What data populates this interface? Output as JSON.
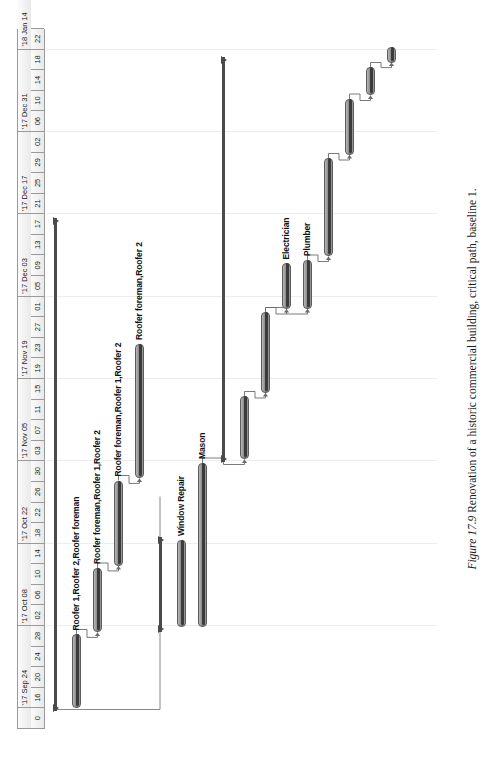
{
  "figure": {
    "number": "Figure 17.9",
    "caption": "Renovation of a historic commercial building, critical path, baseline 1.",
    "full_caption": "Figure 17.9 Renovation of a historic commercial building, critical path, baseline 1."
  },
  "chart_data": {
    "type": "bar",
    "subtype": "gantt",
    "title": "Renovation of a historic commercial building, critical path, baseline 1.",
    "orientation": "rotated-90-on-page",
    "xlabel": "",
    "ylabel": "",
    "grid": true,
    "legend_position": "none",
    "axis": {
      "name": "Timescale",
      "weeks": [
        "'17 Sep 24",
        "'17 Oct 08",
        "'17 Oct 22",
        "'17 Nov 05",
        "'17 Nov 19",
        "'17 Dec 03",
        "'17 Dec 17",
        "'17 Dec 31",
        "'18 Jan 14"
      ],
      "day_ticks": [
        "0",
        "16",
        "20",
        "24",
        "28",
        "02",
        "06",
        "10",
        "14",
        "18",
        "22",
        "26",
        "30",
        "03",
        "07",
        "11",
        "15",
        "19",
        "23",
        "27",
        "01",
        "05",
        "09",
        "13",
        "17",
        "21",
        "25",
        "29",
        "02",
        "06",
        "10",
        "14",
        "18",
        "22"
      ],
      "first_cell_label": "0",
      "range_start": "'17 Sep 16",
      "range_end": "'18 Jan 22"
    },
    "tasks": [
      {
        "id": 1,
        "name": "Project Summary",
        "kind": "summary",
        "label": "",
        "start_pct": 2.5,
        "end_pct": 73.0,
        "row": 0,
        "progress_pct": 0
      },
      {
        "id": 2,
        "name": "Roof demolition",
        "kind": "task",
        "label": "Roofer 1,Roofer 2,Roofer foreman",
        "start_pct": 3.0,
        "end_pct": 13.5,
        "row": 1,
        "progress_pct": 100
      },
      {
        "id": 3,
        "name": "Roof framing",
        "kind": "task",
        "label": "Roofer foreman,Roofer 1,Roofer 2",
        "start_pct": 13.8,
        "end_pct": 23.0,
        "row": 2,
        "progress_pct": 100
      },
      {
        "id": 4,
        "name": "Roof sheathing",
        "kind": "task",
        "label": "Roofer foreman,Roofer 1,Roofer 2",
        "start_pct": 23.3,
        "end_pct": 35.5,
        "row": 3,
        "progress_pct": 100
      },
      {
        "id": 5,
        "name": "Roof covering",
        "kind": "task",
        "label": "Roofer foreman,Roofer 2",
        "start_pct": 35.8,
        "end_pct": 55.0,
        "row": 4,
        "progress_pct": 100
      },
      {
        "id": 6,
        "name": "Window work summary",
        "kind": "summary",
        "label": "",
        "start_pct": 13.8,
        "end_pct": 27.5,
        "row": 5,
        "progress_pct": 0
      },
      {
        "id": 7,
        "name": "Window Repair",
        "kind": "task",
        "label": "Window Repair",
        "start_pct": 14.5,
        "end_pct": 27.0,
        "row": 6,
        "progress_pct": 100
      },
      {
        "id": 8,
        "name": "Masonry",
        "kind": "task",
        "label": "Mason",
        "start_pct": 14.5,
        "end_pct": 38.0,
        "row": 7,
        "progress_pct": 100
      },
      {
        "id": 9,
        "name": "Interior summary",
        "kind": "summary",
        "label": "",
        "start_pct": 38.2,
        "end_pct": 96.0,
        "row": 8,
        "progress_pct": 0
      },
      {
        "id": 10,
        "name": "Interior demolition",
        "kind": "task",
        "label": "",
        "start_pct": 38.5,
        "end_pct": 47.5,
        "row": 9,
        "progress_pct": 100
      },
      {
        "id": 11,
        "name": "Framing",
        "kind": "task",
        "label": "",
        "start_pct": 48.0,
        "end_pct": 59.5,
        "row": 10,
        "progress_pct": 100
      },
      {
        "id": 12,
        "name": "Electrical rough-in",
        "kind": "task",
        "label": "Electrician",
        "start_pct": 60.0,
        "end_pct": 66.5,
        "row": 11,
        "progress_pct": 100
      },
      {
        "id": 13,
        "name": "Plumbing rough-in",
        "kind": "task",
        "label": "Plumber",
        "start_pct": 60.0,
        "end_pct": 67.0,
        "row": 12,
        "progress_pct": 100
      },
      {
        "id": 14,
        "name": "Drywall",
        "kind": "task",
        "label": "",
        "start_pct": 67.5,
        "end_pct": 81.5,
        "row": 13,
        "progress_pct": 100
      },
      {
        "id": 15,
        "name": "Finishes",
        "kind": "task",
        "label": "",
        "start_pct": 82.0,
        "end_pct": 90.0,
        "row": 14,
        "progress_pct": 100
      },
      {
        "id": 16,
        "name": "Fixtures",
        "kind": "task",
        "label": "",
        "start_pct": 90.5,
        "end_pct": 94.5,
        "row": 15,
        "progress_pct": 100
      },
      {
        "id": 17,
        "name": "Punch list",
        "kind": "task",
        "label": "",
        "start_pct": 95.2,
        "end_pct": 97.5,
        "row": 16,
        "progress_pct": 100
      }
    ],
    "colors": {
      "bar_fill": "#8e8e8e",
      "bar_border": "#5c5c5c",
      "progress": "#3b3b3b",
      "summary": "#4a4a4a",
      "link": "#6b6b6b",
      "header_bg": "#f0f0f0",
      "header_border": "#9a9a9a",
      "gridline": "#ededed",
      "page_bg": "#ffffff",
      "text": "#111111"
    }
  }
}
